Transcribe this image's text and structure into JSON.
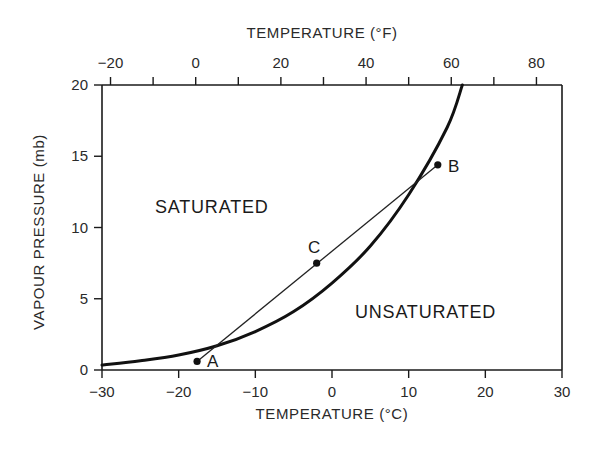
{
  "chart_data": {
    "type": "line",
    "title": "",
    "xlabel": "TEMPERATURE (°C)",
    "x2label": "TEMPERATURE (°F)",
    "ylabel": "VAPOUR PRESSURE (mb)",
    "xlim": [
      -30,
      30
    ],
    "ylim": [
      0,
      20
    ],
    "x_ticks": [
      -30,
      -20,
      -10,
      0,
      10,
      20,
      30
    ],
    "x2_tick_labels": [
      -20,
      0,
      20,
      40,
      60,
      80
    ],
    "x2_minor_ticks_F": [
      -10,
      10,
      30,
      50,
      70
    ],
    "y_ticks": [
      0,
      5,
      10,
      15,
      20
    ],
    "grid": false,
    "series": [
      {
        "name": "Saturation vapour pressure curve",
        "x": [
          -30,
          -25,
          -20,
          -15,
          -10,
          -5,
          0,
          5,
          10,
          15,
          17
        ],
        "values": [
          0.35,
          0.65,
          1.05,
          1.7,
          2.7,
          4.1,
          6.1,
          8.7,
          12.3,
          17.0,
          20.0
        ]
      },
      {
        "name": "Mixing line A–B",
        "x": [
          -17.6,
          13.8
        ],
        "values": [
          0.6,
          14.4
        ]
      }
    ],
    "points": [
      {
        "label": "A",
        "x": -17.6,
        "y": 0.6
      },
      {
        "label": "B",
        "x": 13.8,
        "y": 14.4
      },
      {
        "label": "C",
        "x": -2.0,
        "y": 7.5
      }
    ],
    "annotations": [
      {
        "text": "SATURATED",
        "x": -22,
        "y": 11.2
      },
      {
        "text": "UNSATURATED",
        "x": 3,
        "y": 4.3
      }
    ]
  },
  "labels": {
    "top_axis_title": "TEMPERATURE (°F)",
    "bottom_axis_title": "TEMPERATURE (°C)",
    "y_axis_title": "VAPOUR PRESSURE (mb)",
    "saturated": "SATURATED",
    "unsaturated": "UNSATURATED",
    "point_a": "A",
    "point_b": "B",
    "point_c": "C"
  }
}
